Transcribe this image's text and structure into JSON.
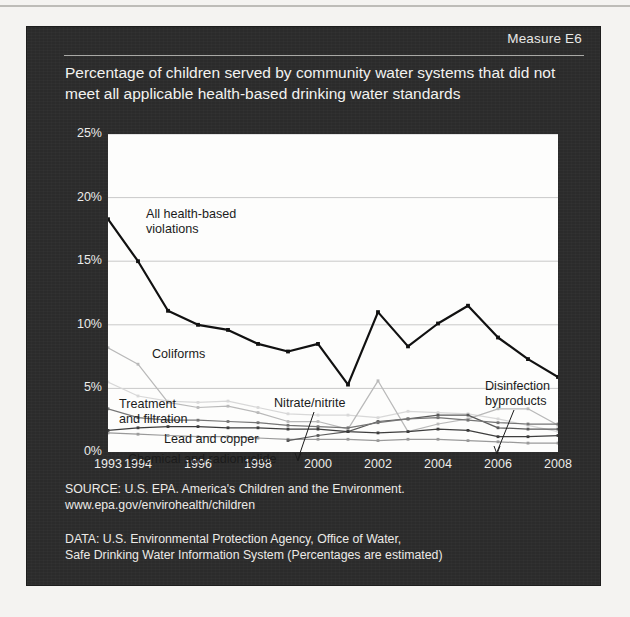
{
  "measure_label": "Measure E6",
  "title": "Percentage of children served by community water systems that did not meet all applicable health-based drinking water standards",
  "source_text": "SOURCE: U.S. EPA. America's Children and the Environment.\nwww.epa.gov/envirohealth/children",
  "data_text": "DATA: U.S. Environmental Protection Agency, Office of Water,\nSafe Drinking Water Information System (Percentages are estimated)",
  "colors": {
    "panel": "#2b2b2b",
    "plot_background": "#fdfdfc",
    "gridline": "#c9c9c9",
    "all_violations": "#111111",
    "coliforms": "#b9b9b9",
    "treatment_filtration": "#d8d8d8",
    "lead_copper": "#757575",
    "chemical_radionuclide": "#3d3d3d",
    "nitrate_nitrite": "#9a9a9a",
    "disinfection_byproducts": "#5a5a5a"
  },
  "annotations": [
    {
      "name": "all-health-based-violations",
      "text": "All health-based\nviolations"
    },
    {
      "name": "coliforms",
      "text": "Coliforms"
    },
    {
      "name": "treatment-and-filtration",
      "text": "Treatment\nand filtration"
    },
    {
      "name": "lead-and-copper",
      "text": "Lead and copper"
    },
    {
      "name": "chemical-and-radionuclide",
      "text": "Chemical and radionuclide"
    },
    {
      "name": "nitrate-nitrite",
      "text": "Nitrate/nitrite"
    },
    {
      "name": "disinfection-byproducts",
      "text": "Disinfection\nbyproducts"
    }
  ],
  "chart_data": {
    "type": "line",
    "title": "Percentage of children served by community water systems that did not meet all applicable health-based drinking water standards",
    "xlabel": "",
    "ylabel": "",
    "xlim": [
      1993,
      2008
    ],
    "ylim": [
      0,
      25
    ],
    "ytick_labels": [
      "0%",
      "5%",
      "10%",
      "15%",
      "20%",
      "25%"
    ],
    "ytick_values": [
      0,
      5,
      10,
      15,
      20,
      25
    ],
    "xtick_labels": [
      "1993",
      "1994",
      "1996",
      "1998",
      "2000",
      "2002",
      "2004",
      "2006",
      "2008"
    ],
    "xtick_values": [
      1993,
      1994,
      1996,
      1998,
      2000,
      2002,
      2004,
      2006,
      2008
    ],
    "grid": true,
    "legend": "inline-annotations",
    "x": [
      1993,
      1994,
      1995,
      1996,
      1997,
      1998,
      1999,
      2000,
      2001,
      2002,
      2003,
      2004,
      2005,
      2006,
      2007,
      2008
    ],
    "series": [
      {
        "name": "All health-based violations",
        "color": "#111111",
        "values": [
          18.3,
          15.0,
          11.1,
          10.0,
          9.6,
          8.5,
          7.9,
          8.5,
          5.3,
          11.0,
          8.3,
          10.1,
          11.5,
          9.0,
          7.3,
          5.9
        ]
      },
      {
        "name": "Coliforms",
        "color": "#b9b9b9",
        "values": [
          8.2,
          6.9,
          3.9,
          3.5,
          3.6,
          3.1,
          2.4,
          2.4,
          1.8,
          5.6,
          1.6,
          2.2,
          2.6,
          3.4,
          3.4,
          2.1
        ]
      },
      {
        "name": "Treatment and filtration",
        "color": "#d8d8d8",
        "values": [
          5.5,
          4.4,
          4.0,
          3.9,
          4.0,
          3.5,
          3.0,
          2.9,
          2.9,
          2.7,
          3.2,
          3.1,
          3.0,
          2.6,
          2.1,
          1.6
        ]
      },
      {
        "name": "Lead and copper",
        "color": "#757575",
        "values": [
          3.4,
          2.7,
          2.5,
          2.5,
          2.4,
          2.3,
          2.1,
          2.0,
          1.9,
          2.3,
          2.6,
          2.7,
          2.5,
          2.3,
          2.2,
          2.2
        ]
      },
      {
        "name": "Chemical and radionuclide",
        "color": "#3d3d3d",
        "values": [
          1.7,
          1.9,
          2.0,
          2.0,
          1.9,
          1.9,
          1.8,
          1.8,
          1.6,
          1.5,
          1.6,
          1.8,
          1.7,
          1.2,
          1.2,
          1.3
        ]
      },
      {
        "name": "Nitrate/nitrite",
        "color": "#9a9a9a",
        "values": [
          1.5,
          1.4,
          1.3,
          1.2,
          1.2,
          1.1,
          1.0,
          1.0,
          1.0,
          0.9,
          1.0,
          1.0,
          0.9,
          0.8,
          0.7,
          0.7
        ]
      },
      {
        "name": "Disinfection byproducts",
        "color": "#5a5a5a",
        "values": [
          0.0,
          0.0,
          0.0,
          0.0,
          0.0,
          0.0,
          0.9,
          1.3,
          1.6,
          2.4,
          2.6,
          2.9,
          2.9,
          1.9,
          1.8,
          1.8
        ]
      }
    ]
  }
}
